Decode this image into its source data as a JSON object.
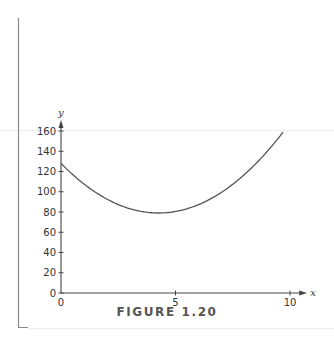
{
  "figure": {
    "caption": "FIGURE 1.20"
  },
  "colors": {
    "axis": "#444444",
    "curve": "#555555",
    "border": "#888888",
    "faint_rule": "#eeeeee"
  },
  "chart_data": {
    "type": "line",
    "title": "",
    "caption": "FIGURE 1.20",
    "xlabel": "x",
    "ylabel": "y",
    "xlim": [
      0,
      10.4
    ],
    "ylim": [
      0,
      168
    ],
    "x_ticks": [
      0,
      5,
      10
    ],
    "x_tick_labels": [
      "0",
      "5",
      "10"
    ],
    "y_ticks": [
      0,
      20,
      40,
      60,
      80,
      100,
      120,
      140,
      160
    ],
    "y_tick_labels": [
      "0",
      "20",
      "40",
      "60",
      "80",
      "100",
      "120",
      "140",
      "160"
    ],
    "grid": false,
    "legend": null,
    "series": [
      {
        "name": "curve",
        "x": [
          0,
          0.5,
          1,
          1.5,
          2,
          2.5,
          3,
          3.5,
          4,
          4.26,
          4.5,
          5,
          5.5,
          6,
          6.5,
          7,
          7.5,
          8,
          8.5,
          9,
          9.5,
          9.7
        ],
        "values": [
          128,
          117.2,
          107.7,
          99.6,
          92.8,
          87.4,
          83.3,
          80.6,
          79.2,
          79.0,
          79.2,
          80.5,
          82.2,
          85.2,
          88.6,
          91.3,
          96.4,
          104.8,
          116.1,
          127.7,
          141.2,
          160
        ]
      }
    ]
  }
}
